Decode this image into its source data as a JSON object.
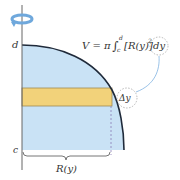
{
  "diagram": {
    "formula": {
      "lhs": "V = π",
      "integral": "∫",
      "upper": "d",
      "lower": "c",
      "integrand": "[R(y)]",
      "exponent": "2",
      "differential": "dy"
    },
    "labels": {
      "d": "d",
      "c": "c",
      "radius": "R(y)",
      "delta_y": "Δy"
    },
    "colors": {
      "region_fill": "#c9e2f5",
      "slab_fill": "#f2d27a",
      "curve": "#1f2a3a",
      "axis": "#666666",
      "arrow": "#6fa8dc",
      "dashed": "#8a7fb5"
    },
    "icons": {
      "rotation": "rotation-arrow-icon"
    }
  }
}
